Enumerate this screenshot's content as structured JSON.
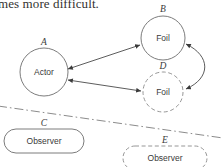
{
  "page": {
    "width": 221,
    "height": 167,
    "background_color": "#ffffff",
    "cropped_caption_text": "mes more difficult."
  },
  "diagram": {
    "title_fragment": "mes more difficult.",
    "stroke_color": "#6d6d6d",
    "connector_color": "#4a4a4a",
    "divider_color": "#7e7e7e",
    "label_color": "#3a3a3a",
    "nodes": [
      {
        "id": "A",
        "id_label": "A",
        "label": "Actor",
        "shape": "circle",
        "style": "solid",
        "cx": 44,
        "cy": 72,
        "r": 24
      },
      {
        "id": "B",
        "id_label": "B",
        "label": "Foil",
        "shape": "circle",
        "style": "solid",
        "cx": 163,
        "cy": 38,
        "r": 22
      },
      {
        "id": "D",
        "id_label": "D",
        "label": "Foil",
        "shape": "circle",
        "style": "dashed",
        "cx": 163,
        "cy": 92,
        "r": 20
      },
      {
        "id": "C",
        "id_label": "C",
        "label": "Observer",
        "shape": "rounded-rect",
        "style": "solid",
        "x": 4,
        "y": 129,
        "w": 80,
        "h": 24
      },
      {
        "id": "E",
        "id_label": "E",
        "label": "Observer",
        "shape": "rounded-rect",
        "style": "dashed",
        "x": 123,
        "y": 146,
        "w": 84,
        "h": 24
      }
    ],
    "edges": [
      {
        "from": "A",
        "to": "B",
        "kind": "double-arrow",
        "path": "straight"
      },
      {
        "from": "A",
        "to": "D",
        "kind": "double-arrow",
        "path": "straight"
      },
      {
        "from": "B",
        "to": "D",
        "kind": "double-arrow",
        "path": "curved"
      }
    ],
    "divider": {
      "kind": "dash-dot-line",
      "x1": 0,
      "y1": 107,
      "x2": 221,
      "y2": 137
    }
  }
}
